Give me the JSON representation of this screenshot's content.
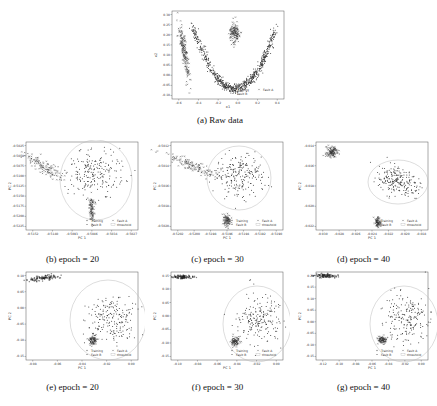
{
  "chart_data": [
    {
      "id": "a",
      "type": "scatter",
      "title": "",
      "caption": "(a) Raw data",
      "xlabel": "x1",
      "ylabel": "x2",
      "xticks": [
        "-0.6",
        "-0.4",
        "-0.2",
        "0.0",
        "0.2",
        "0.4"
      ],
      "yticks": [
        "0.30",
        "0.25",
        "0.20",
        "0.15",
        "0.10",
        "0.05",
        "0.00",
        "-0.05",
        "-0.10"
      ],
      "xlim": [
        -0.7,
        0.55
      ],
      "ylim": [
        -0.1,
        0.3
      ],
      "legend": [
        "Training",
        "Fault A",
        "Fault B"
      ],
      "legend_position": "lower right",
      "series": [
        {
          "name": "Training",
          "shape": "parabola",
          "x_range": [
            -0.5,
            0.5
          ],
          "y_min": 0.0,
          "y_max": 0.28,
          "vertex_x": 0.0
        },
        {
          "name": "Fault A",
          "shape": "diagonal band",
          "x_range": [
            -0.65,
            -0.6
          ],
          "y_range": [
            0.02,
            0.2
          ]
        },
        {
          "name": "Fault B",
          "shape": "compact cluster",
          "x_center": 0.0,
          "y_center": 0.2,
          "x_spread": 0.03,
          "y_spread": 0.04
        }
      ]
    },
    {
      "id": "b",
      "type": "scatter",
      "caption": "(b) epoch = 20",
      "xlabel": "PC 1",
      "ylabel": "PC 2",
      "xticks": [
        "-0.5152",
        "-0.5140",
        "-0.5093",
        "-0.5046",
        "-0.5034",
        "-0.5027"
      ],
      "yticks": [
        "-0.5025",
        "-0.5050",
        "-0.5075",
        "-0.5100",
        "-0.5125",
        "-0.5150",
        "-0.5175",
        "-0.5200",
        "-0.5225"
      ],
      "legend": [
        "Training",
        "Fault A",
        "Fault B",
        "threshold"
      ],
      "legend_position": "lower right",
      "series": [
        {
          "name": "Training",
          "shape": "spread cloud inside threshold circle"
        },
        {
          "name": "Fault A",
          "shape": "diagonal band upper-left"
        },
        {
          "name": "Fault B",
          "shape": "vertical cluster bottom-center"
        },
        {
          "name": "threshold",
          "shape": "circle"
        }
      ]
    },
    {
      "id": "c",
      "type": "scatter",
      "caption": "(c) epoch = 30",
      "xlabel": "PC 1",
      "ylabel": "PC 2",
      "xticks": [
        "-0.5202",
        "-0.5200",
        "-0.5198",
        "-0.5196",
        "-0.5194",
        "-0.5192",
        "-0.5190"
      ],
      "yticks": [
        "-0.5012",
        "-0.5014",
        "-0.5016",
        "-0.5018",
        "-0.5020"
      ],
      "legend": [
        "Training",
        "Fault A",
        "Fault B",
        "threshold"
      ],
      "legend_position": "lower right",
      "series": [
        {
          "name": "Training",
          "shape": "spread cloud inside threshold circle"
        },
        {
          "name": "Fault A",
          "shape": "diagonal band upper-left"
        },
        {
          "name": "Fault B",
          "shape": "cluster bottom-center"
        },
        {
          "name": "threshold",
          "shape": "circle"
        }
      ]
    },
    {
      "id": "d",
      "type": "scatter",
      "caption": "(d) epoch = 40",
      "xlabel": "PC 1",
      "ylabel": "PC 2",
      "xticks": [
        "-0.030",
        "-0.028",
        "-0.026",
        "-0.024",
        "-0.022",
        "-0.020",
        "-0.018"
      ],
      "yticks": [
        "-0.014",
        "-0.016",
        "-0.018",
        "-0.020",
        "-0.022"
      ],
      "legend": [
        "Training",
        "Fault A",
        "Fault B",
        "threshold"
      ],
      "legend_position": "lower right",
      "series": [
        {
          "name": "Training",
          "shape": "elongated cloud inside threshold ellipse"
        },
        {
          "name": "Fault A",
          "shape": "compact cluster upper-left"
        },
        {
          "name": "Fault B",
          "shape": "small cluster bottom-center"
        },
        {
          "name": "threshold",
          "shape": "ellipse"
        }
      ]
    },
    {
      "id": "e",
      "type": "scatter",
      "caption": "(e) epoch = 20",
      "xlabel": "PC 1",
      "ylabel": "PC 2",
      "xticks": [
        "-0.08",
        "-0.06",
        "-0.04",
        "-0.02",
        "0.00"
      ],
      "yticks": [
        "0.10",
        "0.05",
        "0.00",
        "-0.05",
        "-0.10",
        "-0.15"
      ],
      "legend": [
        "Training",
        "Fault A",
        "Fault B",
        "threshold"
      ],
      "legend_position": "lower right",
      "series": [
        {
          "name": "Training",
          "shape": "cloud inside threshold circle"
        },
        {
          "name": "Fault A",
          "shape": "compact cluster inside circle lower-left"
        },
        {
          "name": "Fault B",
          "shape": "elongated cluster top-left"
        },
        {
          "name": "threshold",
          "shape": "circle"
        }
      ]
    },
    {
      "id": "f",
      "type": "scatter",
      "caption": "(f) epoch = 30",
      "xlabel": "PC 1",
      "ylabel": "PC 2",
      "xticks": [
        "-0.10",
        "-0.08",
        "-0.06",
        "-0.04",
        "-0.02",
        "0.00"
      ],
      "yticks": [
        "0.15",
        "0.10",
        "0.05",
        "0.00",
        "-0.05",
        "-0.10",
        "-0.15"
      ],
      "legend": [
        "Training",
        "Fault A",
        "Fault B",
        "threshold"
      ],
      "legend_position": "lower right",
      "series": [
        {
          "name": "Training",
          "shape": "cloud inside threshold circle"
        },
        {
          "name": "Fault A",
          "shape": "compact cluster inside circle lower-left"
        },
        {
          "name": "Fault B",
          "shape": "elongated cluster top-left"
        },
        {
          "name": "threshold",
          "shape": "circle"
        }
      ]
    },
    {
      "id": "g",
      "type": "scatter",
      "caption": "(g) epoch = 40",
      "xlabel": "PC 1",
      "ylabel": "PC 2",
      "xticks": [
        "-0.12",
        "-0.10",
        "-0.08",
        "-0.06",
        "-0.04",
        "-0.02",
        "0.00"
      ],
      "yticks": [
        "0.20",
        "0.15",
        "0.10",
        "0.05",
        "0.00",
        "-0.05",
        "-0.10",
        "-0.15"
      ],
      "legend": [
        "Training",
        "Fault A",
        "Fault B",
        "threshold"
      ],
      "legend_position": "lower right",
      "series": [
        {
          "name": "Training",
          "shape": "cloud inside threshold circle"
        },
        {
          "name": "Fault A",
          "shape": "compact cluster inside circle lower-left"
        },
        {
          "name": "Fault B",
          "shape": "elongated cluster top-left"
        },
        {
          "name": "threshold",
          "shape": "circle"
        }
      ]
    }
  ],
  "captions": {
    "a": "(a) Raw data",
    "b": "(b) epoch = 20",
    "c": "(c) epoch = 30",
    "d": "(d) epoch = 40",
    "e": "(e) epoch = 20",
    "f": "(f) epoch = 30",
    "g": "(g) epoch = 40"
  },
  "colors": {
    "points": "#444444",
    "axes": "#555555",
    "threshold": "#bbbbbb"
  }
}
